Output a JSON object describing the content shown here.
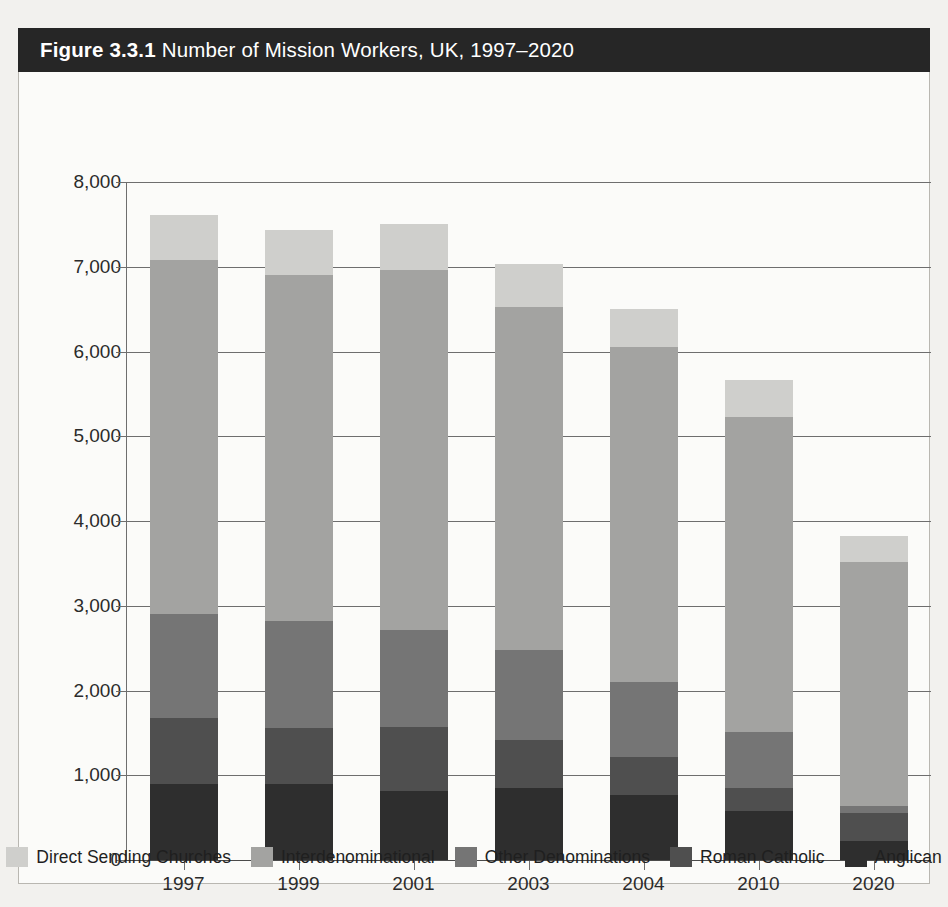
{
  "figure": {
    "number": "Figure 3.3.1",
    "caption": "Number of Mission Workers, UK, 1997–2020"
  },
  "chart_data": {
    "type": "bar",
    "subtype": "stacked-vertical",
    "xlabel": "",
    "ylabel": "",
    "ylim": [
      0,
      8000
    ],
    "ytick_step": 1000,
    "ytick_labels": [
      "0",
      "1,000",
      "2,000",
      "3,000",
      "4,000",
      "5,000",
      "6,000",
      "7,000",
      "8,000"
    ],
    "ytick_values": [
      0,
      1000,
      2000,
      3000,
      4000,
      5000,
      6000,
      7000,
      8000
    ],
    "grid": true,
    "grid_axis": "y",
    "legend_position": "bottom",
    "categories": [
      "1997",
      "1999",
      "2001",
      "2003",
      "2004",
      "2010",
      "2020"
    ],
    "stack_order_bottom_to_top": [
      "Anglican",
      "Roman Catholic",
      "Other Denominations",
      "Interdenominational",
      "Direct Sending Churches"
    ],
    "series": [
      {
        "name": "Anglican",
        "color": "#2e2e2e",
        "values": [
          900,
          900,
          820,
          850,
          770,
          575,
          230
        ]
      },
      {
        "name": "Roman Catholic",
        "color": "#4f4f4f",
        "values": [
          770,
          660,
          750,
          570,
          450,
          275,
          330
        ]
      },
      {
        "name": "Other Denominations",
        "color": "#757575",
        "values": [
          1230,
          1260,
          1140,
          1060,
          880,
          660,
          80
        ]
      },
      {
        "name": "Interdenominational",
        "color": "#a3a3a1",
        "values": [
          4180,
          4080,
          4250,
          4040,
          3950,
          3720,
          2880
        ]
      },
      {
        "name": "Direct Sending Churches",
        "color": "#cfcfcc",
        "values": [
          530,
          530,
          540,
          510,
          450,
          440,
          300
        ]
      }
    ],
    "totals": [
      7610,
      7430,
      7500,
      7030,
      6500,
      5670,
      3820
    ]
  },
  "legend": {
    "items": [
      {
        "label": "Direct Sending Churches",
        "color": "#cfcfcc"
      },
      {
        "label": "Interdenominational",
        "color": "#a3a3a1"
      },
      {
        "label": "Other Denominations",
        "color": "#757575"
      },
      {
        "label": "Roman Catholic",
        "color": "#4f4f4f"
      },
      {
        "label": "Anglican",
        "color": "#2e2e2e"
      }
    ]
  },
  "colors": {
    "title_bar_bg": "#262626",
    "title_text": "#ffffff",
    "page_bg": "#f2f1ee",
    "card_bg": "#fbfbf9",
    "axis": "#6e6e6e",
    "tick_text": "#2b2b2b"
  }
}
